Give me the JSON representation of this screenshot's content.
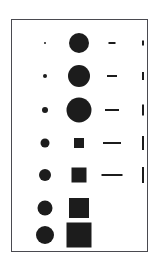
{
  "figure": {
    "background_color": "#ffffff",
    "frame": {
      "x": 11,
      "y": 19,
      "width": 137,
      "height": 233,
      "border_color": "#4a4a50",
      "border_width": 1
    },
    "symbol_color": "#1c1c1c"
  },
  "chart_data": {
    "type": "scatter",
    "title": "",
    "subtitle": "",
    "xlabel": "",
    "ylabel": "",
    "xtick_labels": [],
    "ytick_labels": [],
    "legend": [],
    "annotations": [],
    "grid": false,
    "columns": [
      {
        "name": "column-1-small-circles",
        "glyph": "circle",
        "center_x": 33,
        "row_count": 7,
        "sizes_px": [
          2,
          4,
          6,
          9,
          12,
          15,
          18
        ]
      },
      {
        "name": "column-2-circles-then-squares",
        "glyph": "circle-then-square",
        "center_x": 67,
        "row_count": 7,
        "glyphs": [
          "circle",
          "circle",
          "circle",
          "square",
          "square",
          "square",
          "square"
        ],
        "sizes_px": [
          20,
          22,
          25,
          10,
          15,
          20,
          25
        ]
      },
      {
        "name": "column-3-horizontal-dashes",
        "glyph": "horizontal-bar",
        "center_x": 100,
        "row_count": 5,
        "lengths_px": [
          7,
          10,
          14,
          18,
          21
        ],
        "thickness_px": 2
      },
      {
        "name": "column-4-vertical-bars",
        "glyph": "vertical-bar",
        "center_x": 131,
        "row_count": 5,
        "heights_px": [
          5,
          8,
          11,
          14,
          16
        ],
        "thickness_px": 2
      }
    ],
    "rows": [
      {
        "index": 1,
        "center_y": 23
      },
      {
        "index": 2,
        "center_y": 56
      },
      {
        "index": 3,
        "center_y": 90
      },
      {
        "index": 4,
        "center_y": 123
      },
      {
        "index": 5,
        "center_y": 155
      },
      {
        "index": 6,
        "center_y": 188
      },
      {
        "index": 7,
        "center_y": 215
      }
    ],
    "series": [
      {
        "name": "column-1-small-circles",
        "values": [
          2,
          4,
          6,
          9,
          12,
          15,
          18
        ]
      },
      {
        "name": "column-2-circles-then-squares",
        "values": [
          20,
          22,
          25,
          10,
          15,
          20,
          25
        ]
      },
      {
        "name": "column-3-horizontal-dashes",
        "values": [
          7,
          10,
          14,
          18,
          21
        ]
      },
      {
        "name": "column-4-vertical-bars",
        "values": [
          5,
          8,
          11,
          14,
          16
        ]
      }
    ]
  }
}
